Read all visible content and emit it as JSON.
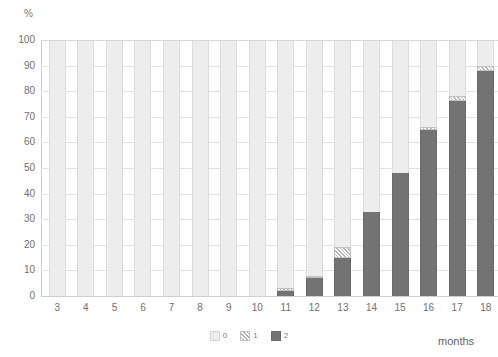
{
  "chart_data": {
    "type": "bar",
    "title": "",
    "subtitle": "",
    "xlabel": "months",
    "ylabel": "%",
    "stacked": true,
    "stack_total": 100,
    "grid": true,
    "legend_position": "bottom-center",
    "ylim": [
      0,
      100
    ],
    "ytick_labels": [
      "0",
      "10",
      "20",
      "30",
      "40",
      "50",
      "60",
      "70",
      "80",
      "90",
      "100"
    ],
    "yticks": [
      0,
      10,
      20,
      30,
      40,
      50,
      60,
      70,
      80,
      90,
      100
    ],
    "categories": [
      "3",
      "4",
      "5",
      "6",
      "7",
      "8",
      "9",
      "10",
      "11",
      "12",
      "13",
      "14",
      "15",
      "16",
      "17",
      "18"
    ],
    "series": [
      {
        "name": "2",
        "label": "2",
        "color": "#737373",
        "fill": "solid",
        "values": [
          0,
          0,
          0,
          0,
          0,
          0,
          0,
          0,
          2,
          7,
          15,
          33,
          48,
          65,
          76,
          88
        ]
      },
      {
        "name": "1",
        "label": "1",
        "color": "#b0b0b0",
        "fill": "diagonal-hatch",
        "values": [
          0,
          0,
          0,
          0,
          0,
          0,
          0,
          0,
          1,
          1,
          4,
          0,
          0,
          1,
          2,
          2
        ]
      },
      {
        "name": "0",
        "label": "0",
        "color": "#ededed",
        "fill": "solid",
        "values": [
          100,
          100,
          100,
          100,
          100,
          100,
          100,
          100,
          97,
          92,
          81,
          67,
          52,
          34,
          22,
          10
        ]
      }
    ]
  },
  "legend": {
    "items": [
      {
        "label": "0",
        "swatch": "light-solid-swatch"
      },
      {
        "label": "1",
        "swatch": "hatched-swatch"
      },
      {
        "label": "2",
        "swatch": "dark-solid-swatch"
      }
    ]
  },
  "axes": {
    "y_unit_label": "%",
    "x_title": "months"
  }
}
